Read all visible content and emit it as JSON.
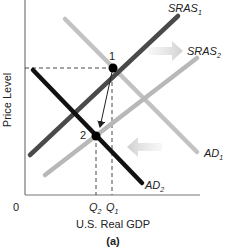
{
  "diagram": {
    "title": "(a)",
    "xlabel": "U.S. Real GDP",
    "ylabel": "Price Level",
    "origin_label": "0",
    "curves": [
      {
        "id": "SRAS1",
        "label": "SRAS",
        "sub": "1",
        "color": "#4a4a4a"
      },
      {
        "id": "SRAS2",
        "label": "SRAS",
        "sub": "2",
        "color": "#b8b8b8"
      },
      {
        "id": "AD1",
        "label": "AD",
        "sub": "1",
        "color": "#c2c2c2"
      },
      {
        "id": "AD2",
        "label": "AD",
        "sub": "2",
        "color": "#111111"
      }
    ],
    "points": [
      {
        "id": "1",
        "label": "1"
      },
      {
        "id": "2",
        "label": "2"
      }
    ],
    "x_ticks": [
      {
        "label": "Q",
        "sub": "2"
      },
      {
        "label": "Q",
        "sub": "1"
      }
    ],
    "shift_arrows": [
      {
        "name": "sras-shift-right",
        "direction": "right"
      },
      {
        "name": "ad-shift-left",
        "direction": "left"
      }
    ]
  }
}
